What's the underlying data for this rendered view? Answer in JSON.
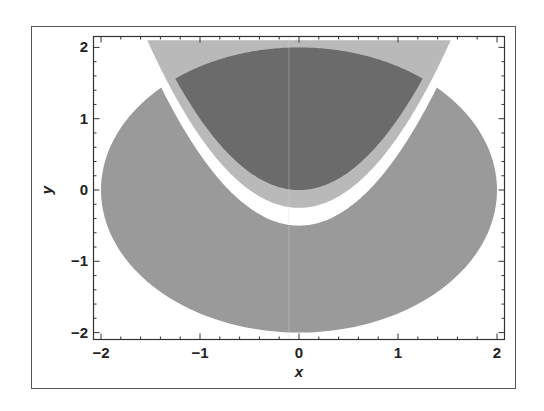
{
  "chart_data": {
    "type": "area",
    "title": "",
    "xlabel": "x",
    "ylabel": "y",
    "xlim": [
      -2.02,
      2.07
    ],
    "ylim": [
      -2.08,
      2.12
    ],
    "xticks": [
      -2,
      -1,
      0,
      1,
      2
    ],
    "yticks": [
      -2,
      -1,
      0,
      1,
      2
    ],
    "xtick_labels": [
      "−2",
      "−1",
      "0",
      "1",
      "2"
    ],
    "ytick_labels": [
      "−2",
      "−1",
      "0",
      "1",
      "2"
    ],
    "grid": false,
    "legend": null,
    "regions": [
      {
        "name": "disk-outside-parabola",
        "description": "x^2 + y^2 <= 4 and y <= x^2 - 0.5",
        "color": "#9a9a9a"
      },
      {
        "name": "above-shifted-parabola",
        "description": "y >= x^2 - 0.25 (clipped to plot range)",
        "color": "#b9b9b9"
      },
      {
        "name": "disk-above-parabola",
        "description": "x^2 + y^2 <= 4 and y >= x^2",
        "color": "#6b6b6b"
      }
    ]
  },
  "colors": {
    "background": "#ffffff",
    "frame": "#444444",
    "medium_gray": "#9a9a9a",
    "light_gray": "#b9b9b9",
    "dark_gray": "#6b6b6b"
  }
}
